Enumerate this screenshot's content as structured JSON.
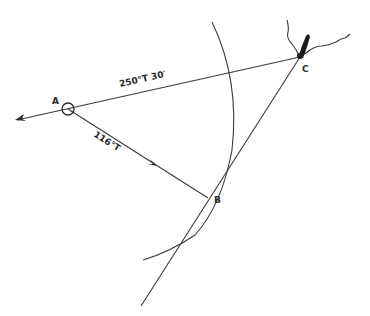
{
  "diagram": {
    "type": "navigation-fix",
    "points": {
      "A": {
        "label": "A"
      },
      "B": {
        "label": "B"
      },
      "C": {
        "label": "C"
      }
    },
    "bearings": {
      "A_to_C": "250°T  30′",
      "A_to_B": "116°T"
    },
    "line_color": "#3a3a3a"
  }
}
